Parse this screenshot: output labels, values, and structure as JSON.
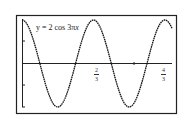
{
  "chart_data": {
    "type": "line",
    "title": "y = 2 cos 3πx",
    "equation": "y = 2 cos 3πx",
    "function": {
      "amplitude": 2,
      "angular_coefficient": "3π",
      "kind": "cos"
    },
    "xlabel": "",
    "ylabel": "",
    "xlim": [
      0,
      1.4
    ],
    "ylim": [
      -2,
      2
    ],
    "x_ticks": [
      {
        "value": 0.6667,
        "label": "2/3",
        "num": "2",
        "den": "3"
      },
      {
        "value": 1.3333,
        "label": "4/3",
        "num": "4",
        "den": "3"
      }
    ],
    "y_ticks": [
      -2,
      -1,
      0,
      1,
      2
    ],
    "grid": false,
    "series": [
      {
        "name": "y = 2cos(3πx)",
        "x": [
          0,
          0.1667,
          0.3333,
          0.5,
          0.6667,
          0.8333,
          1.0,
          1.1667,
          1.3333
        ],
        "values": [
          2,
          0,
          -2,
          0,
          2,
          0,
          -2,
          0,
          2
        ]
      }
    ]
  },
  "labels": {
    "equation_prefix": "y = 2 cos 3π",
    "equation_var": "x",
    "tick1_num": "2",
    "tick1_den": "3",
    "tick2_num": "4",
    "tick2_den": "3"
  }
}
